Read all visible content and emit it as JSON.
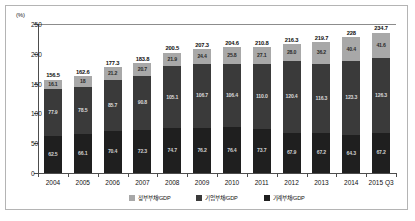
{
  "chart_data": {
    "type": "bar",
    "stacked": true,
    "title": "",
    "subtitle": "",
    "unit_label": "(%)",
    "xlabel": "",
    "ylabel": "",
    "ylim": [
      0,
      250
    ],
    "yticks": [
      0,
      50,
      100,
      150,
      200,
      250
    ],
    "grid": false,
    "legend_position": "bottom",
    "categories": [
      "2004",
      "2005",
      "2006",
      "2007",
      "2008",
      "2009",
      "2010",
      "2011",
      "2012",
      "2013",
      "2014",
      "2015 Q3"
    ],
    "series": [
      {
        "name": "가계부채/GDP",
        "color": "#1f1f1f",
        "values": [
          62.5,
          66.1,
          70.4,
          72.3,
          74.7,
          76.2,
          76.4,
          73.7,
          67.9,
          67.2,
          64.3,
          67.2
        ]
      },
      {
        "name": "기업부채/GDP",
        "color": "#3a3a3a",
        "values": [
          77.9,
          78.5,
          85.7,
          90.8,
          105.1,
          106.7,
          106.4,
          110.0,
          120.4,
          116.3,
          123.3,
          126.3
        ]
      },
      {
        "name": "정부부채/GDP",
        "color": "#a8a8a8",
        "values": [
          16.1,
          18.0,
          21.2,
          20.7,
          21.9,
          24.4,
          28.0,
          27.1,
          28.0,
          36.2,
          40.4,
          41.6
        ]
      }
    ],
    "totals": [
      156.5,
      162.6,
      177.3,
      183.8,
      200.5,
      207.3,
      210.8,
      210.8,
      216.3,
      219.7,
      228,
      234.7
    ],
    "total_labels": [
      "156.5",
      "162.6",
      "177.3",
      "183.8",
      "200.5",
      "207.3",
      "204.6",
      "210.8",
      "216.3",
      "219.7",
      "228",
      "234.7"
    ],
    "segment_labels": {
      "gov": [
        "16.1",
        "18",
        "21.2",
        "20.7",
        "21.9",
        "24.4",
        "25.8",
        "27.1",
        "28.0",
        "36.2",
        "40.4",
        "41.6"
      ],
      "corp": [
        "77.9",
        "78.5",
        "85.7",
        "90.8",
        "105.1",
        "106.7",
        "106.4",
        "110.0",
        "120.4",
        "116.3",
        "123.3",
        "126.3"
      ],
      "house": [
        "62.5",
        "66.1",
        "70.4",
        "72.3",
        "74.7",
        "76.2",
        "76.4",
        "73.7",
        "67.9",
        "67.2",
        "64.3",
        "67.2"
      ]
    }
  },
  "legend": {
    "items": [
      {
        "label": "정부부채/GDP"
      },
      {
        "label": "기업부채/GDP"
      },
      {
        "label": "가계부채/GDP"
      }
    ]
  }
}
